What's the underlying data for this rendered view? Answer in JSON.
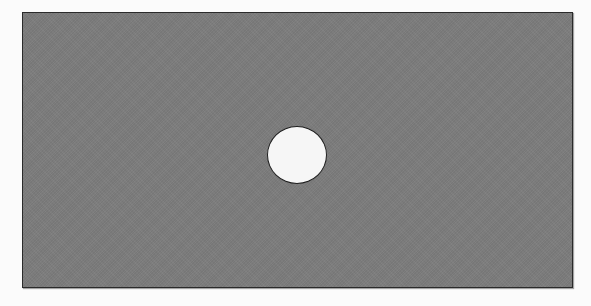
{
  "diagram": {
    "title": "",
    "shapes": [
      {
        "type": "rectangle",
        "role": "plate",
        "fill": "#7d7d7d",
        "stroke": "#2a2a2a",
        "x": 22,
        "y": 12,
        "width": 551,
        "height": 276
      },
      {
        "type": "circle",
        "role": "hole",
        "fill": "#f6f6f6",
        "stroke": "#1e1e1e",
        "cx": 297,
        "cy": 155,
        "rx": 30,
        "ry": 29
      }
    ],
    "colors": {
      "background": "#fbfbfb",
      "plate": "#7d7d7d",
      "hole": "#f6f6f6",
      "outline": "#2a2a2a"
    }
  }
}
